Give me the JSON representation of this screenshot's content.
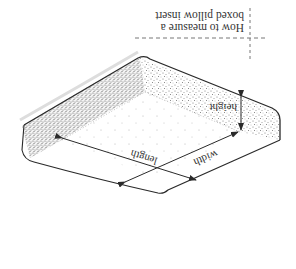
{
  "diagram": {
    "title_line1": "How to measure a",
    "title_line2": "boxed pillow insert",
    "orientation": "rotated 180 degrees",
    "labels": {
      "height": "height",
      "width": "width",
      "length": "length"
    },
    "colors": {
      "line": "#2a2a2a",
      "stipple": "#8a8a8a",
      "guide": "#777777",
      "background": "#ffffff"
    }
  }
}
